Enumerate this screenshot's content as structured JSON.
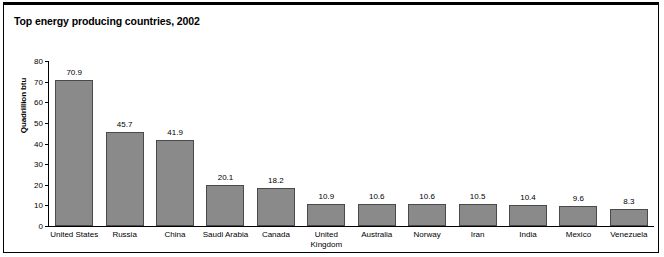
{
  "chart_data": {
    "type": "bar",
    "title": "Top energy producing countries, 2002",
    "xlabel": "",
    "ylabel": "Quadrillion btu",
    "ylim": [
      0,
      80
    ],
    "ytick_step": 10,
    "yticks": [
      80,
      70,
      60,
      50,
      40,
      30,
      20,
      10,
      0
    ],
    "ytick_labels": [
      "80",
      "70",
      "60",
      "50",
      "40",
      "30",
      "20",
      "10",
      "0"
    ],
    "grid": false,
    "legend": false,
    "bar_color": "#8a8a8a",
    "bar_edge_color": "#4a4a4a",
    "categories": [
      "United States",
      "Russia",
      "China",
      "Saudi Arabia",
      "Canada",
      "United Kingdom",
      "Australia",
      "Norway",
      "Iran",
      "India",
      "Mexico",
      "Venezuela"
    ],
    "values": [
      70.9,
      45.7,
      41.9,
      20.1,
      18.2,
      10.9,
      10.6,
      10.6,
      10.5,
      10.4,
      9.6,
      8.3
    ],
    "value_labels": [
      "70.9",
      "45.7",
      "41.9",
      "20.1",
      "18.2",
      "10.9",
      "10.6",
      "10.6",
      "10.5",
      "10.4",
      "9.6",
      "8.3"
    ]
  }
}
